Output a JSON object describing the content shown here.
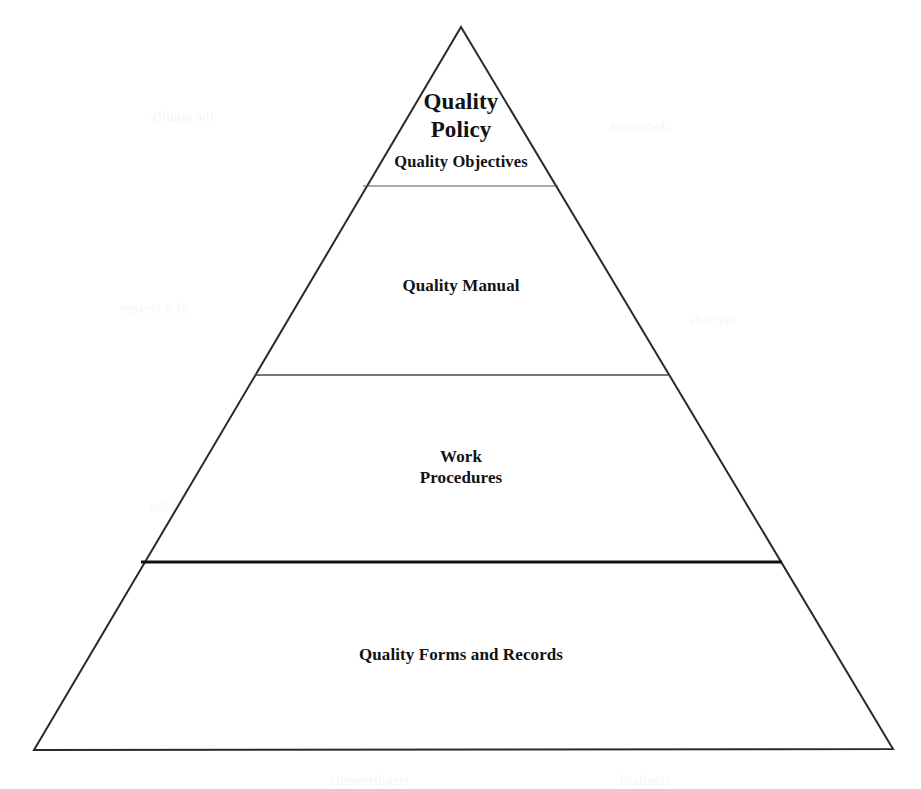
{
  "document": {
    "title": "Quality Documentation Pyramid",
    "type": "pyramid-diagram",
    "background_color": "#ffffff",
    "outline_color": "#2a2a2a",
    "text_color": "#121212"
  },
  "diagram": {
    "shape": "triangle",
    "apex": {
      "x": 461,
      "y": 27
    },
    "base_left": {
      "x": 34,
      "y": 750
    },
    "base_right": {
      "x": 893,
      "y": 749
    },
    "outline_width_px": 2,
    "fill": "#ffffff",
    "tiers": [
      {
        "index": 1,
        "name": "quality-policy",
        "title": "Quality\nPolicy",
        "subtitle": "Quality Objectives",
        "title_font_size_px": 23,
        "subtitle_font_size_px": 16.5,
        "divider_below": {
          "y": 186,
          "x_start": 363,
          "x_end": 558,
          "width_px": 1.2,
          "color": "#555555"
        }
      },
      {
        "index": 2,
        "name": "quality-manual",
        "title": "Quality Manual",
        "title_font_size_px": 17,
        "divider_below": {
          "y": 375,
          "x_start": 255,
          "x_end": 668,
          "width_px": 1.3,
          "color": "#4a4a4a"
        }
      },
      {
        "index": 3,
        "name": "work-procedures",
        "title": "Work\nProcedures",
        "title_font_size_px": 17,
        "divider_below": {
          "y": 562,
          "x_start": 141,
          "x_end": 782,
          "width_px": 3,
          "color": "#111111"
        }
      },
      {
        "index": 4,
        "name": "quality-forms-and-records",
        "title": "Quality Forms and Records",
        "title_font_size_px": 17,
        "divider_below": null
      }
    ]
  },
  "ghosting": [
    {
      "text": "the quality",
      "x": 150,
      "y": 108
    },
    {
      "text": "document",
      "x": 610,
      "y": 118
    },
    {
      "text": "of a system",
      "x": 120,
      "y": 300
    },
    {
      "text": "records",
      "x": 690,
      "y": 312
    },
    {
      "text": "manual",
      "x": 575,
      "y": 398
    },
    {
      "text": "procedure",
      "x": 575,
      "y": 432
    },
    {
      "text": "control",
      "x": 585,
      "y": 470
    },
    {
      "text": "and the",
      "x": 150,
      "y": 498
    },
    {
      "text": "quality of",
      "x": 235,
      "y": 566
    },
    {
      "text": "in a process",
      "x": 470,
      "y": 566
    },
    {
      "text": "internal audit",
      "x": 660,
      "y": 566
    },
    {
      "text": "review",
      "x": 610,
      "y": 600
    },
    {
      "text": "the system",
      "x": 160,
      "y": 700
    },
    {
      "text": "requirements",
      "x": 330,
      "y": 772
    },
    {
      "text": "standard",
      "x": 620,
      "y": 772
    }
  ]
}
